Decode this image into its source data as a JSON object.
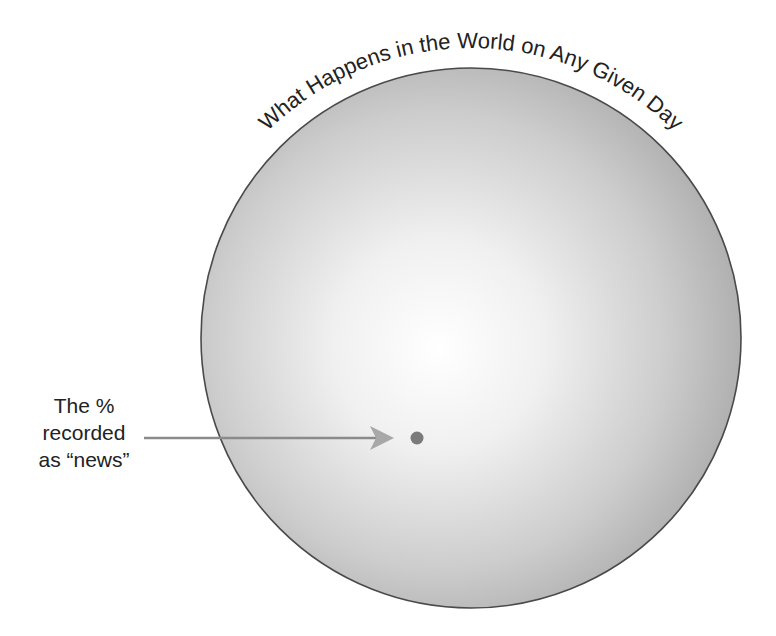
{
  "diagram": {
    "title": "What Happens in the World on Any Given Day",
    "annotation": {
      "lines": [
        "The %",
        "recorded",
        "as “news”"
      ]
    },
    "shapes": {
      "world_circle": {
        "cx": 471,
        "cy": 338,
        "r": 270,
        "edge_color": "#4a4a4a",
        "fill_dark": "#b4b4b4",
        "fill_light": "#ffffff"
      },
      "news_dot": {
        "cx": 417,
        "cy": 438,
        "r": 6,
        "color": "#7a7a7a"
      },
      "arrow": {
        "x1": 144,
        "y1": 438,
        "x2": 392,
        "y2": 438,
        "color": "#8a8a8a"
      }
    }
  }
}
